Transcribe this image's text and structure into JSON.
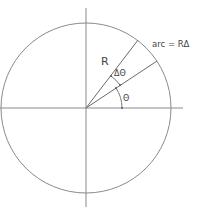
{
  "diagram": {
    "labels": {
      "radius": "R",
      "delta_theta": "ΔΘ",
      "theta": "Θ",
      "arc": "arc = RΔ"
    },
    "colors": {
      "stroke": "#7a7a7a",
      "text": "#444444",
      "background": "#ffffff"
    },
    "geometry": {
      "center": [
        86,
        108
      ],
      "radius": 85
    }
  }
}
